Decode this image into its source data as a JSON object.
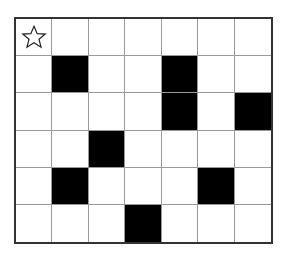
{
  "puzzle": {
    "rows": 6,
    "cols": 7,
    "colors": {
      "filled": "#000000",
      "empty": "#ffffff",
      "grid_line": "#9a9a9a",
      "border": "#333333"
    },
    "filled_cells": [
      [
        1,
        1
      ],
      [
        1,
        4
      ],
      [
        2,
        4
      ],
      [
        2,
        6
      ],
      [
        3,
        2
      ],
      [
        4,
        1
      ],
      [
        4,
        5
      ],
      [
        5,
        3
      ]
    ],
    "markers": [
      {
        "row": 0,
        "col": 0,
        "icon": "star-outline-icon",
        "glyph": "☆"
      }
    ]
  }
}
